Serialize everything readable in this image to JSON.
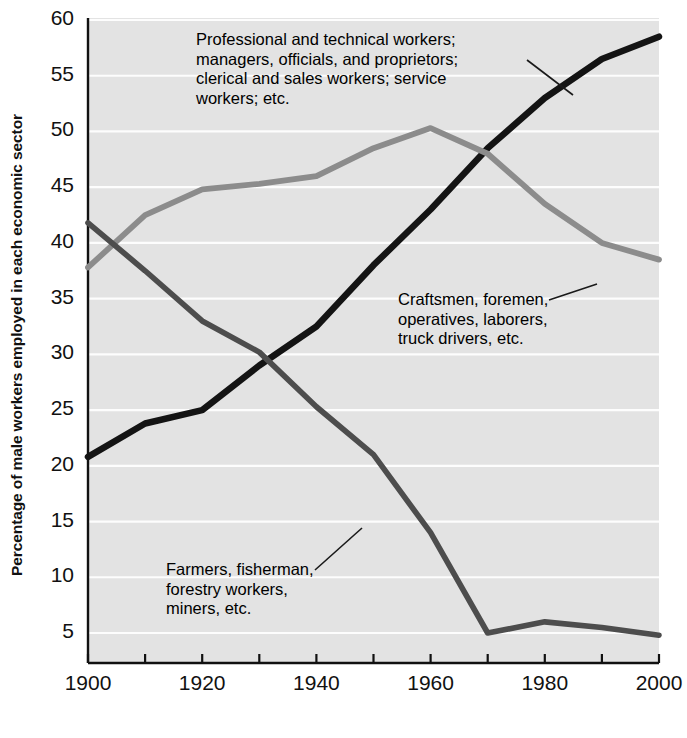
{
  "chart_data": {
    "type": "line",
    "title": "",
    "xlabel": "",
    "ylabel": "Percentage of male workers employed in each economic sector",
    "xlim": [
      1900,
      2000
    ],
    "ylim": [
      0,
      60
    ],
    "grid": true,
    "legend_position": "inline-annotations",
    "x_ticks_major": [
      1900,
      1920,
      1940,
      1960,
      1980,
      2000
    ],
    "x_tick_labels": [
      "1900",
      "1920",
      "1940",
      "1960",
      "1980",
      "2000"
    ],
    "x_ticks_minor": [
      1910,
      1930,
      1950,
      1970,
      1990
    ],
    "y_ticks": [
      5,
      10,
      15,
      20,
      25,
      30,
      35,
      40,
      45,
      50,
      55,
      60
    ],
    "y_tick_labels": [
      "5",
      "10",
      "15",
      "20",
      "25",
      "30",
      "35",
      "40",
      "45",
      "50",
      "55",
      "60"
    ],
    "x": [
      1900,
      1910,
      1920,
      1930,
      1940,
      1950,
      1960,
      1970,
      1980,
      1990,
      2000
    ],
    "series": [
      {
        "name": "Professional and technical workers; managers, officials, and proprietors; clerical and sales workers; service workers; etc.",
        "color": "#141414",
        "values": [
          20.8,
          23.8,
          25.0,
          29.0,
          32.5,
          38.0,
          43.0,
          48.5,
          53.0,
          56.5,
          58.5
        ]
      },
      {
        "name": "Craftsmen, foremen, operatives, laborers, truck drivers, etc.",
        "color": "#8c8c8c",
        "values": [
          37.8,
          42.5,
          44.8,
          45.3,
          46.0,
          48.5,
          50.3,
          48.0,
          43.5,
          40.0,
          38.5
        ]
      },
      {
        "name": "Farmers, fisherman, forestry workers, miners, etc.",
        "color": "#4d4d4d",
        "values": [
          41.8,
          37.5,
          33.0,
          30.2,
          25.3,
          21.0,
          14.0,
          5.0,
          6.0,
          5.5,
          4.8
        ]
      }
    ]
  },
  "axis": {
    "y_title": "Percentage of male workers employed in each economic sector"
  },
  "annotations": [
    {
      "id": "professional",
      "text": "Professional and technical workers;\nmanagers, officials, and proprietors;\nclerical and sales workers; service\nworkers; etc.",
      "leader_from": [
        527,
        60
      ],
      "leader_to": [
        573,
        95
      ]
    },
    {
      "id": "craftsmen",
      "text": "Craftsmen, foremen,\noperatives, laborers,\ntruck drivers, etc.",
      "leader_from": [
        549,
        300
      ],
      "leader_to": [
        597,
        284
      ]
    },
    {
      "id": "farmers",
      "text": "Farmers, fisherman,\nforestry workers,\nminers, etc.",
      "leader_from": [
        315,
        570
      ],
      "leader_to": [
        362,
        528
      ]
    }
  ],
  "colors": {
    "plot_background": "#e3e3e3",
    "gridline": "#fdfdfd",
    "axis": "#111111",
    "series_professional": "#141414",
    "series_craftsmen": "#8c8c8c",
    "series_farmers": "#4d4d4d"
  }
}
